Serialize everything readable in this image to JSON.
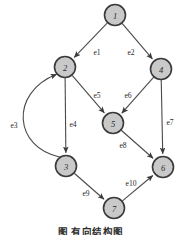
{
  "figure": {
    "caption": "图       有向结构图",
    "background_color": "#ffffff",
    "node_fill_color": "#c9c9c9",
    "node_stroke_color": "#3a3a3a",
    "edge_color": "#4a4a4a",
    "text_color": "#1f1f1f"
  },
  "graph": {
    "type": "directed-graph",
    "node_radius": 10.5,
    "nodes": [
      {
        "id": "1",
        "label": "1",
        "x": 115,
        "y": 15
      },
      {
        "id": "2",
        "label": "2",
        "x": 65,
        "y": 67
      },
      {
        "id": "3",
        "label": "3",
        "x": 66,
        "y": 166
      },
      {
        "id": "4",
        "label": "4",
        "x": 161,
        "y": 69
      },
      {
        "id": "5",
        "label": "5",
        "x": 113,
        "y": 123
      },
      {
        "id": "6",
        "label": "6",
        "x": 163,
        "y": 167
      },
      {
        "id": "7",
        "label": "7",
        "x": 114,
        "y": 208
      }
    ],
    "edges": [
      {
        "id": "e1",
        "label": "e1",
        "from": "1",
        "to": "2",
        "label_x": 97,
        "label_y": 52,
        "shape": "straight"
      },
      {
        "id": "e2",
        "label": "e2",
        "from": "1",
        "to": "4",
        "label_x": 131,
        "label_y": 52,
        "shape": "straight"
      },
      {
        "id": "e3",
        "label": "e3",
        "from": "3",
        "to": "2",
        "label_x": 14,
        "label_y": 125,
        "shape": "curve"
      },
      {
        "id": "e4",
        "label": "e4",
        "from": "2",
        "to": "3",
        "label_x": 73,
        "label_y": 124,
        "shape": "straight"
      },
      {
        "id": "e5",
        "label": "e5",
        "from": "2",
        "to": "5",
        "label_x": 97,
        "label_y": 95,
        "shape": "straight"
      },
      {
        "id": "e6",
        "label": "e6",
        "from": "4",
        "to": "5",
        "label_x": 128,
        "label_y": 95,
        "shape": "straight"
      },
      {
        "id": "e7",
        "label": "e7",
        "from": "4",
        "to": "6",
        "label_x": 170,
        "label_y": 122,
        "shape": "straight"
      },
      {
        "id": "e8",
        "label": "e8",
        "from": "5",
        "to": "6",
        "label_x": 123,
        "label_y": 145,
        "shape": "straight"
      },
      {
        "id": "e9",
        "label": "e9",
        "from": "3",
        "to": "7",
        "label_x": 86,
        "label_y": 193,
        "shape": "straight"
      },
      {
        "id": "e10",
        "label": "e10",
        "from": "7",
        "to": "6",
        "label_x": 131,
        "label_y": 183,
        "shape": "straight"
      }
    ]
  }
}
